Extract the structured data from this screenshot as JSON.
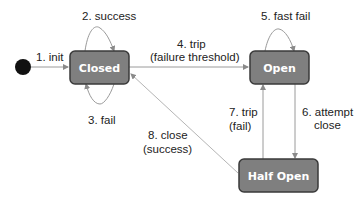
{
  "diagram": {
    "type": "state-machine",
    "colors": {
      "state_fill": "#7f7f7f",
      "state_border": "#3a3a3a",
      "state_text": "#ffffff",
      "edge": "#9a9a9a",
      "initial_node": "#111111",
      "label_text": "#222222"
    },
    "states": [
      {
        "id": "closed",
        "label": "Closed"
      },
      {
        "id": "open",
        "label": "Open"
      },
      {
        "id": "half_open",
        "label": "Half Open"
      }
    ],
    "transitions": [
      {
        "id": "init",
        "from": "initial",
        "to": "closed",
        "label": "1. init"
      },
      {
        "id": "success",
        "from": "closed",
        "to": "closed",
        "label": "2. success"
      },
      {
        "id": "fail",
        "from": "closed",
        "to": "closed",
        "label": "3. fail"
      },
      {
        "id": "trip_threshold",
        "from": "closed",
        "to": "open",
        "label_line1": "4. trip",
        "label_line2": "(failure threshold)"
      },
      {
        "id": "fast_fail",
        "from": "open",
        "to": "open",
        "label": "5. fast fail"
      },
      {
        "id": "attempt_close",
        "from": "open",
        "to": "half_open",
        "label_line1": "6. attempt",
        "label_line2": "close"
      },
      {
        "id": "trip_fail",
        "from": "half_open",
        "to": "open",
        "label_line1": "7. trip",
        "label_line2": "(fail)"
      },
      {
        "id": "close_success",
        "from": "half_open",
        "to": "closed",
        "label_line1": "8. close",
        "label_line2": "(success)"
      }
    ]
  }
}
